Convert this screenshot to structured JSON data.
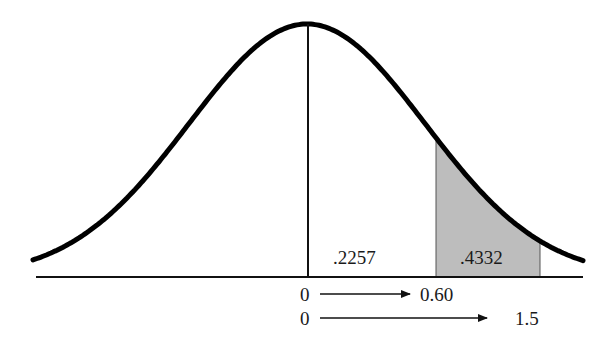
{
  "chart_data": {
    "type": "area",
    "title": "",
    "xlabel": "",
    "ylabel": "",
    "curve": {
      "distribution": "normal",
      "mean": 0,
      "sd": 1
    },
    "mean_line": {
      "z": 0
    },
    "regions": [
      {
        "from": 0,
        "to": 0.6,
        "label": ".2257",
        "shaded": false
      },
      {
        "from": 0.6,
        "to": 1.5,
        "label": ".4332",
        "shaded": true,
        "color": "#bdbdbd"
      }
    ],
    "arrows": [
      {
        "from_label": "0",
        "to_label": "0.60"
      },
      {
        "from_label": "0",
        "to_label": "1.5"
      }
    ],
    "grid": false,
    "legend": null
  },
  "labels": {
    "region1": ".2257",
    "region2": ".4332",
    "arrow1_start": "0",
    "arrow1_end": "0.60",
    "arrow2_start": "0",
    "arrow2_end": "1.5"
  },
  "colors": {
    "curve": "#000000",
    "shade": "#bdbdbd",
    "axis": "#111111"
  }
}
